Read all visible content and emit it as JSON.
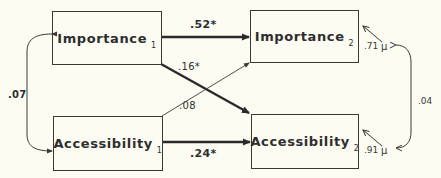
{
  "nodes": {
    "importance_1": {
      "label": "Importance",
      "sub": "1"
    },
    "importance_2": {
      "label": "Importance",
      "sub": "2"
    },
    "accessibility_1": {
      "label": "Accessibility",
      "sub": "1"
    },
    "accessibility_2": {
      "label": "Accessibility",
      "sub": "2"
    }
  },
  "paths": {
    "imp1_imp2": ".52*",
    "imp1_acc2": ".16*",
    "acc1_imp2": ".08",
    "acc1_acc2": ".24*",
    "imp1_acc1_cov": ".07",
    "residual_cov": ".04"
  },
  "residuals": {
    "importance_2": {
      "value": ".71",
      "symbol": "μ"
    },
    "accessibility_2": {
      "value": ".91",
      "symbol": "μ"
    }
  }
}
